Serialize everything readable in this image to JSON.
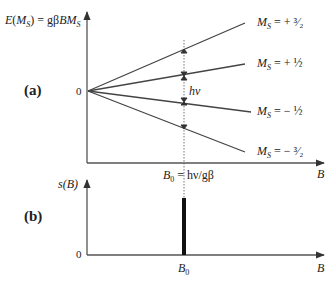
{
  "panel_a": {
    "tag": "(a)",
    "y_axis_label": "E(M_S) = gβBM_S",
    "y_axis_label_parts": {
      "lhs_E": "E(",
      "lhs_M": "M",
      "lhs_S": "S",
      "lhs_close": ")",
      "eq": " = gβB",
      "rhs_M": "M",
      "rhs_S": "S"
    },
    "origin_label": "0",
    "x_axis_label": "B",
    "transition_label": "hν",
    "resonance_label": "B₀ = hν/gβ",
    "resonance_parts": {
      "B": "B",
      "sub": "0",
      "rest": " = hν/gβ"
    },
    "levels": [
      {
        "ms": "+3/2",
        "label_prefix": "M",
        "label_sub": "S",
        "label_value": " = + ³⁄₂",
        "slope": 1.5
      },
      {
        "ms": "+1/2",
        "label_prefix": "M",
        "label_sub": "S",
        "label_value": " = + ½",
        "slope": 0.5
      },
      {
        "ms": "-1/2",
        "label_prefix": "M",
        "label_sub": "S",
        "label_value": " = − ½",
        "slope": -0.5
      },
      {
        "ms": "-3/2",
        "label_prefix": "M",
        "label_sub": "S",
        "label_value": " = − ³⁄₂",
        "slope": -1.5
      }
    ]
  },
  "panel_b": {
    "tag": "(b)",
    "y_axis_label": "s(B)",
    "origin_label": "0",
    "x_axis_label": "B",
    "peak_label": "B₀",
    "peak_parts": {
      "B": "B",
      "sub": "0"
    }
  }
}
